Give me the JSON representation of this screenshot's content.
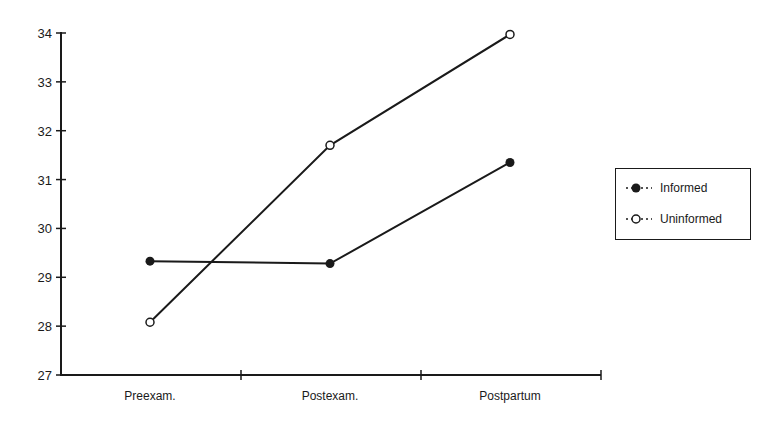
{
  "chart_data": {
    "type": "line",
    "title": "",
    "xlabel": "",
    "ylabel": "",
    "categories": [
      "Preexam.",
      "Postexam.",
      "Postpartum"
    ],
    "series": [
      {
        "name": "Informed",
        "marker": "filled-circle",
        "values": [
          29.33,
          29.28,
          31.35
        ]
      },
      {
        "name": "Uninformed",
        "marker": "open-circle",
        "values": [
          28.08,
          31.7,
          33.97
        ]
      }
    ],
    "ylim": [
      27,
      34
    ],
    "yticks": [
      27,
      28,
      29,
      30,
      31,
      32,
      33,
      34
    ],
    "grid": false,
    "legend_position": "right"
  },
  "legend": {
    "items": [
      {
        "label": "Informed",
        "marker": "filled-circle"
      },
      {
        "label": "Uninformed",
        "marker": "open-circle"
      }
    ]
  },
  "colors": {
    "axis": "#1a1a1a",
    "line": "#1a1a1a",
    "background": "#ffffff"
  }
}
